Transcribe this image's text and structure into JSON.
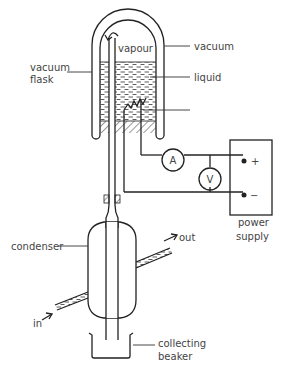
{
  "diagram": {
    "title": "",
    "labels": {
      "vapour": "vapour",
      "vacuum": "vacuum",
      "vacuum_flask_line1": "vacuum",
      "vacuum_flask_line2": "flask",
      "liquid": "liquid",
      "ammeter": "A",
      "voltmeter": "V",
      "plus": "+",
      "minus": "−",
      "power_supply_line1": "power",
      "power_supply_line2": "supply",
      "condenser": "condenser",
      "out": "out",
      "in": "in",
      "collecting_beaker_line1": "collecting",
      "collecting_beaker_line2": "beaker"
    },
    "components": [
      "vacuum flask",
      "liquid",
      "heater coil",
      "ammeter",
      "voltmeter",
      "power supply",
      "condenser",
      "collecting beaker"
    ],
    "colors": {
      "line": "#222222",
      "text": "#444444",
      "background": "#ffffff"
    }
  }
}
